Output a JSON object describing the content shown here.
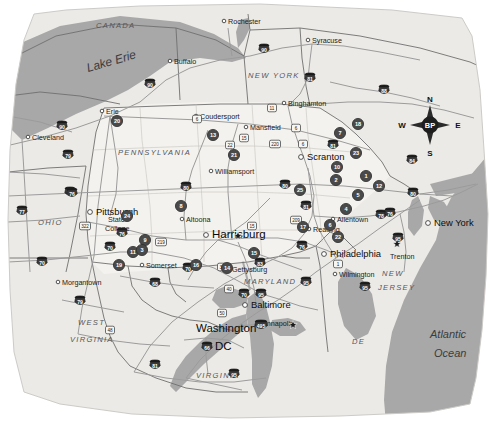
{
  "map": {
    "title": "Pennsylvania and Surrounding States Site Location Map",
    "background_color": "#ffffff",
    "land_color": "#eceae6",
    "highlight_state_color": "#f4f2ee",
    "water_color": "#a8a8a8",
    "marker_color": "#4a4a4a",
    "road_color": "#9b9b9b",
    "border_color": "#6f6f6f"
  },
  "compass": {
    "north": "N",
    "south": "S",
    "east": "E",
    "west": "W",
    "center_label": "BP"
  },
  "water_bodies": [
    {
      "name": "Lake Erie",
      "label": "Lake Erie",
      "x": 88,
      "y": 72,
      "rotate": -16,
      "class": "water-label"
    },
    {
      "name": "Atlantic Ocean line 1",
      "label": "Atlantic",
      "x": 430,
      "y": 338,
      "rotate": 0,
      "class": "ocean-label"
    },
    {
      "name": "Atlantic Ocean line 2",
      "label": "Ocean",
      "x": 434,
      "y": 357,
      "rotate": 0,
      "class": "ocean-label"
    }
  ],
  "states": [
    {
      "name": "CANADA",
      "label": "CANADA",
      "x": 96,
      "y": 28,
      "size": 7.6
    },
    {
      "name": "NEW YORK",
      "label": "NEW YORK",
      "x": 248,
      "y": 78,
      "size": 7.6
    },
    {
      "name": "PENNSYLVANIA",
      "label": "PENNSYLVANIA",
      "x": 118,
      "y": 155,
      "size": 7.6
    },
    {
      "name": "OHIO",
      "label": "OHIO",
      "x": 38,
      "y": 225,
      "size": 7.6
    },
    {
      "name": "WEST VIRGINIA line 1",
      "label": "WEST",
      "x": 78,
      "y": 325,
      "size": 7.6
    },
    {
      "name": "WEST VIRGINIA line 2",
      "label": "VIRGINIA",
      "x": 70,
      "y": 342,
      "size": 7.6
    },
    {
      "name": "VIRGINIA",
      "label": "VIRGINIA",
      "x": 196,
      "y": 378,
      "size": 7.6
    },
    {
      "name": "MARYLAND",
      "label": "MARYLAND",
      "x": 244,
      "y": 284,
      "size": 7.0
    },
    {
      "name": "NEW JERSEY line 1",
      "label": "NEW",
      "x": 382,
      "y": 276,
      "size": 6.6
    },
    {
      "name": "NEW JERSEY line 2",
      "label": "JERSEY",
      "x": 378,
      "y": 290,
      "size": 6.6
    },
    {
      "name": "DELAWARE",
      "label": "DE",
      "x": 352,
      "y": 344,
      "size": 6.6
    }
  ],
  "cities": [
    {
      "name": "Rochester",
      "label": "Rochester",
      "x": 228,
      "y": 24,
      "dot": true,
      "size": "small"
    },
    {
      "name": "Syracuse",
      "label": "Syracuse",
      "x": 312,
      "y": 43,
      "dot": true,
      "size": "small"
    },
    {
      "name": "Buffalo",
      "label": "Buffalo",
      "x": 174,
      "y": 64,
      "dot": true,
      "size": "small"
    },
    {
      "name": "Binghamton",
      "label": "Binghamton",
      "x": 288,
      "y": 106,
      "dot": true,
      "size": "small"
    },
    {
      "name": "Erie",
      "label": "Erie",
      "x": 106,
      "y": 114,
      "dot": true,
      "size": "small"
    },
    {
      "name": "Cleveland",
      "label": "Cleveland",
      "x": 32,
      "y": 140,
      "dot": true,
      "size": "small"
    },
    {
      "name": "Coudersport",
      "label": "Coudersport",
      "x": 200,
      "y": 119,
      "dot": true,
      "size": "small"
    },
    {
      "name": "Mansfield",
      "label": "Mansfield",
      "x": 250,
      "y": 130,
      "dot": true,
      "size": "small"
    },
    {
      "name": "Scranton",
      "label": "Scranton",
      "x": 307,
      "y": 160,
      "dot": true,
      "size": "major"
    },
    {
      "name": "Williamsport",
      "label": "Williamsport",
      "x": 215,
      "y": 174,
      "dot": true,
      "size": "small"
    },
    {
      "name": "Pittsburgh",
      "label": "Pittsburgh",
      "x": 96,
      "y": 215,
      "dot": true,
      "size": "major"
    },
    {
      "name": "State College line 1",
      "label": "State",
      "x": 108,
      "y": 222,
      "dot": false,
      "size": "small"
    },
    {
      "name": "Altoona",
      "label": "Altoona",
      "x": 186,
      "y": 222,
      "dot": true,
      "size": "small"
    },
    {
      "name": "Allentown",
      "label": "Allentown",
      "x": 337,
      "y": 222,
      "dot": true,
      "size": "small"
    },
    {
      "name": "Reading",
      "label": "Reading",
      "x": 313,
      "y": 232,
      "dot": true,
      "size": "small"
    },
    {
      "name": "Harrisburg",
      "label": "Harrisburg",
      "x": 212,
      "y": 238,
      "dot": true,
      "size": "big"
    },
    {
      "name": "New York",
      "label": "New York",
      "x": 434,
      "y": 226,
      "dot": true,
      "size": "major"
    },
    {
      "name": "Somerset",
      "label": "Somerset",
      "x": 146,
      "y": 268,
      "dot": true,
      "size": "small"
    },
    {
      "name": "Philadelphia",
      "label": "Philadelphia",
      "x": 330,
      "y": 257,
      "dot": true,
      "size": "major"
    },
    {
      "name": "Gettysburg",
      "label": "Gettysburg",
      "x": 232,
      "y": 272,
      "dot": true,
      "size": "small"
    },
    {
      "name": "Morgantown",
      "label": "Morgantown",
      "x": 62,
      "y": 285,
      "dot": true,
      "size": "small"
    },
    {
      "name": "Wilmington",
      "label": "Wilmington",
      "x": 339,
      "y": 277,
      "dot": true,
      "size": "small"
    },
    {
      "name": "Trenton",
      "label": "Trenton",
      "x": 390,
      "y": 259,
      "dot": false,
      "size": "small"
    },
    {
      "name": "Baltimore",
      "label": "Baltimore",
      "x": 251,
      "y": 308,
      "dot": true,
      "size": "major"
    },
    {
      "name": "Annapolis",
      "label": "Annapolis",
      "x": 262,
      "y": 326,
      "dot": false,
      "size": "small"
    },
    {
      "name": "Washington DC line 1",
      "label": "Washington",
      "x": 196,
      "y": 332,
      "dot": false,
      "size": "big"
    },
    {
      "name": "Washington DC line 2",
      "label": "DC",
      "x": 215,
      "y": 350,
      "dot": false,
      "size": "big"
    }
  ],
  "capitals": [
    {
      "name": "Harrisburg capital star",
      "x": 238,
      "y": 236
    },
    {
      "name": "Trenton capital star",
      "x": 397,
      "y": 244
    },
    {
      "name": "Annapolis capital star",
      "x": 293,
      "y": 325
    }
  ],
  "state_label_extra": [
    {
      "name": "State College line 2",
      "label": "College",
      "x": 105,
      "y": 231
    }
  ],
  "interstate_shields": [
    {
      "name": "I-90 Buffalo",
      "number": "90",
      "x": 150,
      "y": 84
    },
    {
      "name": "I-90 Erie",
      "number": "90",
      "x": 62,
      "y": 126
    },
    {
      "name": "I-90 Syracuse",
      "number": "90",
      "x": 264,
      "y": 49
    },
    {
      "name": "I-81 Syracuse",
      "number": "81",
      "x": 310,
      "y": 78
    },
    {
      "name": "I-88",
      "number": "88",
      "x": 384,
      "y": 90
    },
    {
      "name": "I-79 Erie",
      "number": "79",
      "x": 68,
      "y": 155
    },
    {
      "name": "I-80 Ohio",
      "number": "80",
      "x": 70,
      "y": 192
    },
    {
      "name": "I-76 Pittsburgh",
      "number": "76",
      "x": 72,
      "y": 193
    },
    {
      "name": "I-77 Ohio",
      "number": "77",
      "x": 22,
      "y": 211
    },
    {
      "name": "I-80 Central PA",
      "number": "80",
      "x": 186,
      "y": 187
    },
    {
      "name": "I-80 East PA",
      "number": "80",
      "x": 285,
      "y": 185
    },
    {
      "name": "I-81 Scranton",
      "number": "81",
      "x": 333,
      "y": 145
    },
    {
      "name": "I-81 South",
      "number": "81",
      "x": 306,
      "y": 206
    },
    {
      "name": "I-84",
      "number": "84",
      "x": 412,
      "y": 160
    },
    {
      "name": "I-70 Ohio",
      "number": "70",
      "x": 42,
      "y": 262
    },
    {
      "name": "I-76 Turnpike",
      "number": "76",
      "x": 122,
      "y": 233
    },
    {
      "name": "I-70 Somerset",
      "number": "70",
      "x": 110,
      "y": 247
    },
    {
      "name": "I-70 East",
      "number": "70",
      "x": 188,
      "y": 268
    },
    {
      "name": "I-68",
      "number": "68",
      "x": 155,
      "y": 283
    },
    {
      "name": "I-79 Morgantown",
      "number": "79",
      "x": 80,
      "y": 301
    },
    {
      "name": "I-81 Virginia",
      "number": "81",
      "x": 155,
      "y": 365
    },
    {
      "name": "I-83 Harrisburg",
      "number": "83",
      "x": 260,
      "y": 263
    },
    {
      "name": "I-78 Allentown",
      "number": "78",
      "x": 381,
      "y": 215
    },
    {
      "name": "I-76 Philadelphia",
      "number": "76",
      "x": 302,
      "y": 246
    },
    {
      "name": "I-95 Philadelphia",
      "number": "95",
      "x": 306,
      "y": 282
    },
    {
      "name": "I-80 New Jersey",
      "number": "80",
      "x": 413,
      "y": 193
    },
    {
      "name": "I-76 NJ",
      "number": "76",
      "x": 390,
      "y": 213
    },
    {
      "name": "I-95 NJ",
      "number": "95",
      "x": 398,
      "y": 238
    },
    {
      "name": "I-95 Baltimore",
      "number": "95",
      "x": 261,
      "y": 294
    },
    {
      "name": "I-70 Baltimore",
      "number": "70",
      "x": 244,
      "y": 294
    },
    {
      "name": "I-66 Washington",
      "number": "66",
      "x": 207,
      "y": 347
    },
    {
      "name": "I-495 Annapolis",
      "number": "495",
      "x": 261,
      "y": 325
    },
    {
      "name": "I-95 Virginia",
      "number": "95",
      "x": 234,
      "y": 374
    },
    {
      "name": "I-95 East",
      "number": "95",
      "x": 365,
      "y": 287
    }
  ],
  "us_routes": [
    {
      "name": "US-6 NY",
      "number": "6",
      "x": 197,
      "y": 119
    },
    {
      "name": "US-11 Binghamton",
      "number": "11",
      "x": 272,
      "y": 108
    },
    {
      "name": "US-6 Mansfield",
      "number": "6",
      "x": 296,
      "y": 128
    },
    {
      "name": "US-15 Williamsport",
      "number": "15",
      "x": 244,
      "y": 138
    },
    {
      "name": "US-6 Scranton",
      "number": "6",
      "x": 303,
      "y": 144
    },
    {
      "name": "US-220",
      "number": "220",
      "x": 275,
      "y": 144
    },
    {
      "name": "US-322 State College",
      "number": "322",
      "x": 85,
      "y": 226
    },
    {
      "name": "US-22 Altoona",
      "number": "22",
      "x": 230,
      "y": 145
    },
    {
      "name": "US-219 Somerset",
      "number": "219",
      "x": 161,
      "y": 242
    },
    {
      "name": "US-15 Harrisburg",
      "number": "15",
      "x": 252,
      "y": 226
    },
    {
      "name": "US-30 Gettysburg",
      "number": "30",
      "x": 222,
      "y": 267
    },
    {
      "name": "US-209",
      "number": "209",
      "x": 296,
      "y": 220
    },
    {
      "name": "US-1 Philadelphia",
      "number": "1",
      "x": 338,
      "y": 264
    },
    {
      "name": "US-40",
      "number": "40",
      "x": 229,
      "y": 289
    },
    {
      "name": "US-50",
      "number": "50",
      "x": 222,
      "y": 313
    },
    {
      "name": "US-48 WV",
      "number": "48",
      "x": 110,
      "y": 330
    }
  ],
  "site_markers": [
    {
      "name": "site-marker-20",
      "number": "20",
      "x": 117,
      "y": 121
    },
    {
      "name": "site-marker-13",
      "number": "13",
      "x": 213,
      "y": 135
    },
    {
      "name": "site-marker-21",
      "number": "21",
      "x": 234,
      "y": 155
    },
    {
      "name": "site-marker-18",
      "number": "18",
      "x": 358,
      "y": 124
    },
    {
      "name": "site-marker-7",
      "number": "7",
      "x": 340,
      "y": 133
    },
    {
      "name": "site-marker-23",
      "number": "23",
      "x": 356,
      "y": 153
    },
    {
      "name": "site-marker-10",
      "number": "10",
      "x": 337,
      "y": 167
    },
    {
      "name": "site-marker-2",
      "number": "2",
      "x": 336,
      "y": 180
    },
    {
      "name": "site-marker-1",
      "number": "1",
      "x": 366,
      "y": 176
    },
    {
      "name": "site-marker-12",
      "number": "12",
      "x": 379,
      "y": 186
    },
    {
      "name": "site-marker-5",
      "number": "5",
      "x": 358,
      "y": 195
    },
    {
      "name": "site-marker-4",
      "number": "4",
      "x": 346,
      "y": 209
    },
    {
      "name": "site-marker-6",
      "number": "6",
      "x": 330,
      "y": 225
    },
    {
      "name": "site-marker-22",
      "number": "22",
      "x": 338,
      "y": 237
    },
    {
      "name": "site-marker-24",
      "number": "24",
      "x": 127,
      "y": 216
    },
    {
      "name": "site-marker-8",
      "number": "8",
      "x": 181,
      "y": 206
    },
    {
      "name": "site-marker-9",
      "number": "9",
      "x": 145,
      "y": 240
    },
    {
      "name": "site-marker-11",
      "number": "11",
      "x": 133,
      "y": 252
    },
    {
      "name": "site-marker-3",
      "number": "3",
      "x": 142,
      "y": 250
    },
    {
      "name": "site-marker-19",
      "number": "19",
      "x": 119,
      "y": 265
    },
    {
      "name": "site-marker-17",
      "number": "17",
      "x": 303,
      "y": 227
    },
    {
      "name": "site-marker-15",
      "number": "15",
      "x": 254,
      "y": 253
    },
    {
      "name": "site-marker-16",
      "number": "16",
      "x": 196,
      "y": 265
    },
    {
      "name": "site-marker-14",
      "number": "14",
      "x": 227,
      "y": 268
    },
    {
      "name": "site-marker-25",
      "number": "25",
      "x": 300,
      "y": 190
    }
  ]
}
